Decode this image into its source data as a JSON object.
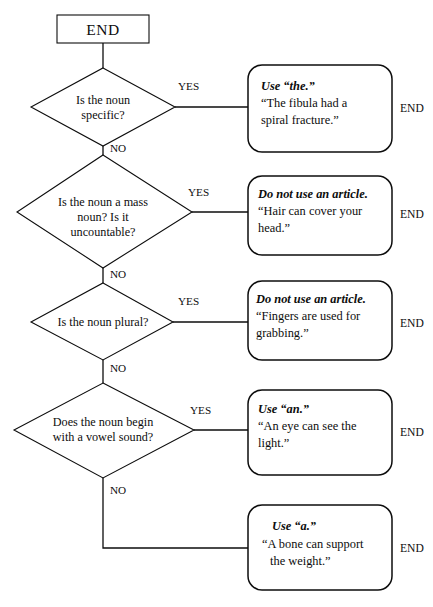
{
  "diagram": {
    "start_label": "START",
    "yes_label": "YES",
    "no_label": "NO",
    "end_label": "END",
    "steps": [
      {
        "question_lines": [
          "Is the noun",
          "specific?"
        ],
        "yes": "YES",
        "no": "NO",
        "outcome_rule": "Use “the.”",
        "outcome_example_lines": [
          "“The fibula had a",
          "spiral fracture.”"
        ],
        "end": "END"
      },
      {
        "question_lines": [
          "Is the noun a mass",
          "noun? Is it",
          "uncountable?"
        ],
        "yes": "YES",
        "no": "NO",
        "outcome_rule": "Do not use an article.",
        "outcome_example_lines": [
          "“Hair can cover your",
          "head.”"
        ],
        "end": "END"
      },
      {
        "question_lines": [
          "Is the noun plural?"
        ],
        "yes": "YES",
        "no": "NO",
        "outcome_rule": "Do not use an article.",
        "outcome_example_lines": [
          "“Fingers are used for",
          "grabbing.”"
        ],
        "end": "END"
      },
      {
        "question_lines": [
          "Does the noun begin",
          "with a vowel sound?"
        ],
        "yes": "YES",
        "no": "NO",
        "outcome_rule": "Use “an.”",
        "outcome_example_lines": [
          "“An eye can see the",
          "light.”"
        ],
        "end": "END"
      },
      {
        "question_lines": [],
        "yes": "",
        "no": "NO",
        "outcome_rule": "Use “a.”",
        "outcome_example_lines": [
          "“A bone can support",
          "the weight.”"
        ],
        "end": "END"
      }
    ]
  },
  "colors": {
    "ink": "#0d0d0d",
    "background": "#ffffff"
  }
}
